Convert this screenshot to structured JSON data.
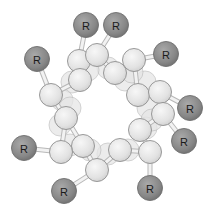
{
  "diagram": {
    "type": "alpha-helix end view (ball model)",
    "colors": {
      "background": "#ffffff",
      "backbone_atom": "#e4e4e4",
      "backbone_stroke": "#8f8f8f",
      "r_group": "#8a8a8a",
      "r_group_stroke": "#6e6e6e",
      "label": "#1a1a1a"
    },
    "r_groups": [
      {
        "label": "R",
        "x": 86,
        "y": 25,
        "attach": [
          79,
          61
        ]
      },
      {
        "label": "R",
        "x": 116,
        "y": 25,
        "attach": [
          97,
          55
        ]
      },
      {
        "label": "R",
        "x": 37,
        "y": 59,
        "attach": [
          51,
          95
        ]
      },
      {
        "label": "R",
        "x": 166,
        "y": 54,
        "attach": [
          134,
          60
        ]
      },
      {
        "label": "R",
        "x": 190,
        "y": 108,
        "attach": [
          160,
          92
        ]
      },
      {
        "label": "R",
        "x": 184,
        "y": 141,
        "attach": [
          163,
          114
        ]
      },
      {
        "label": "R",
        "x": 24,
        "y": 148,
        "attach": [
          61,
          152
        ]
      },
      {
        "label": "R",
        "x": 64,
        "y": 191,
        "attach": [
          97,
          170
        ]
      },
      {
        "label": "R",
        "x": 150,
        "y": 188,
        "attach": [
          150,
          152
        ]
      }
    ],
    "backbone_front": [
      [
        79,
        61
      ],
      [
        97,
        55
      ],
      [
        80,
        80
      ],
      [
        115,
        73
      ],
      [
        134,
        60
      ],
      [
        138,
        95
      ],
      [
        160,
        92
      ],
      [
        163,
        114
      ],
      [
        140,
        130
      ],
      [
        150,
        152
      ],
      [
        120,
        150
      ],
      [
        97,
        170
      ],
      [
        83,
        146
      ],
      [
        61,
        152
      ],
      [
        66,
        118
      ],
      [
        51,
        95
      ]
    ],
    "backbone_back": [
      [
        72,
        82
      ],
      [
        108,
        68
      ],
      [
        125,
        80
      ],
      [
        145,
        82
      ],
      [
        148,
        108
      ],
      [
        146,
        128
      ],
      [
        128,
        150
      ],
      [
        108,
        154
      ],
      [
        90,
        150
      ],
      [
        70,
        145
      ],
      [
        60,
        125
      ],
      [
        62,
        100
      ],
      [
        88,
        70
      ],
      [
        132,
        72
      ],
      [
        152,
        120
      ],
      [
        70,
        108
      ]
    ],
    "bonds": [
      [
        [
          79,
          61
        ],
        [
          80,
          80
        ]
      ],
      [
        [
          97,
          55
        ],
        [
          115,
          73
        ]
      ],
      [
        [
          80,
          80
        ],
        [
          51,
          95
        ]
      ],
      [
        [
          115,
          73
        ],
        [
          134,
          60
        ]
      ],
      [
        [
          134,
          60
        ],
        [
          138,
          95
        ]
      ],
      [
        [
          138,
          95
        ],
        [
          160,
          92
        ]
      ],
      [
        [
          160,
          92
        ],
        [
          163,
          114
        ]
      ],
      [
        [
          163,
          114
        ],
        [
          140,
          130
        ]
      ],
      [
        [
          140,
          130
        ],
        [
          150,
          152
        ]
      ],
      [
        [
          150,
          152
        ],
        [
          120,
          150
        ]
      ],
      [
        [
          120,
          150
        ],
        [
          97,
          170
        ]
      ],
      [
        [
          97,
          170
        ],
        [
          83,
          146
        ]
      ],
      [
        [
          83,
          146
        ],
        [
          61,
          152
        ]
      ],
      [
        [
          61,
          152
        ],
        [
          66,
          118
        ]
      ],
      [
        [
          66,
          118
        ],
        [
          51,
          95
        ]
      ],
      [
        [
          79,
          61
        ],
        [
          97,
          55
        ]
      ],
      [
        [
          66,
          118
        ],
        [
          83,
          146
        ]
      ]
    ]
  }
}
